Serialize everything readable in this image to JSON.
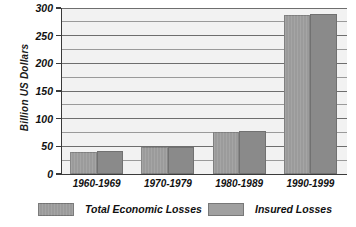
{
  "chart_data": {
    "type": "bar",
    "title": "",
    "subtitle": "",
    "xlabel": "",
    "ylabel": "Billion US Dollars",
    "categories": [
      "1960-1969",
      "1970-1979",
      "1980-1989",
      "1990-1999"
    ],
    "series": [
      {
        "name": "Total Economic Losses",
        "values": [
          40,
          48,
          76,
          288
        ],
        "color": "#9b9b9b"
      },
      {
        "name": "Insured Losses",
        "values": [
          41,
          49,
          77,
          289
        ],
        "color": "#8a8a8a"
      }
    ],
    "ylim": [
      0,
      300
    ],
    "ytick_labels": [
      "0",
      "50",
      "100",
      "150",
      "200",
      "250",
      "300"
    ],
    "ytick_values": [
      0,
      50,
      100,
      150,
      200,
      250,
      300
    ],
    "gridline_values": [
      25,
      50,
      75,
      100,
      125,
      150,
      175,
      200,
      225,
      250,
      275,
      300
    ],
    "grid": true,
    "legend_position": "bottom",
    "plot_background": "#f2f2f2",
    "axis_color": "#3a3a3a",
    "gridline_color": "#9a9a9a"
  },
  "axis": {
    "y_title": "Billion US Dollars"
  },
  "legend": {
    "items": [
      {
        "label": "Total Economic Losses"
      },
      {
        "label": "Insured Losses"
      }
    ]
  }
}
